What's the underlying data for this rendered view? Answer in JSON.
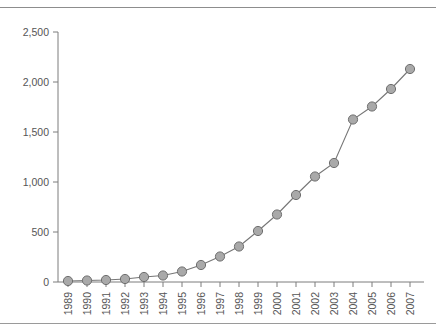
{
  "chart_data": {
    "type": "line",
    "title": "",
    "subtitle": "",
    "xlabel": "",
    "ylabel": "",
    "grid": false,
    "legend": null,
    "legend_position": "none",
    "xlim": [
      1989,
      2007
    ],
    "ylim": [
      0,
      2500
    ],
    "y_ticks": [
      0,
      500,
      1000,
      1500,
      2000,
      2500
    ],
    "y_tick_labels": [
      "0",
      "500",
      "1,000",
      "1,500",
      "2,000",
      "2,500"
    ],
    "x_tick_labels": [
      "1989",
      "1990",
      "1991",
      "1992",
      "1993",
      "1994",
      "1995",
      "1996",
      "1997",
      "1998",
      "1999",
      "2000",
      "2001",
      "2002",
      "2003",
      "2004",
      "2005",
      "2006",
      "2007"
    ],
    "categories": [
      1989,
      1990,
      1991,
      1992,
      1993,
      1994,
      1995,
      1996,
      1997,
      1998,
      1999,
      2000,
      2001,
      2002,
      2003,
      2004,
      2005,
      2006,
      2007
    ],
    "values": [
      10,
      15,
      20,
      30,
      50,
      65,
      105,
      170,
      255,
      355,
      510,
      675,
      870,
      1055,
      1190,
      1625,
      1755,
      1930,
      2130
    ],
    "marker": "circle",
    "marker_color": "#a9a9a9",
    "marker_edge_color": "#6e6e6e",
    "line_color": "#767676",
    "axis_color": "#7d7d7d",
    "background_color": "#ffffff"
  },
  "frame": {
    "top_rule": "",
    "bottom_rule": ""
  }
}
